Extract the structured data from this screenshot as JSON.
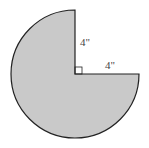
{
  "diagram": {
    "shape": "three-quarter circle sector",
    "fill_color": "#c9c9c9",
    "stroke_color": "#222222",
    "labels": {
      "vertical_radius": "4\"",
      "horizontal_radius": "4\""
    },
    "right_angle_marker": true
  }
}
